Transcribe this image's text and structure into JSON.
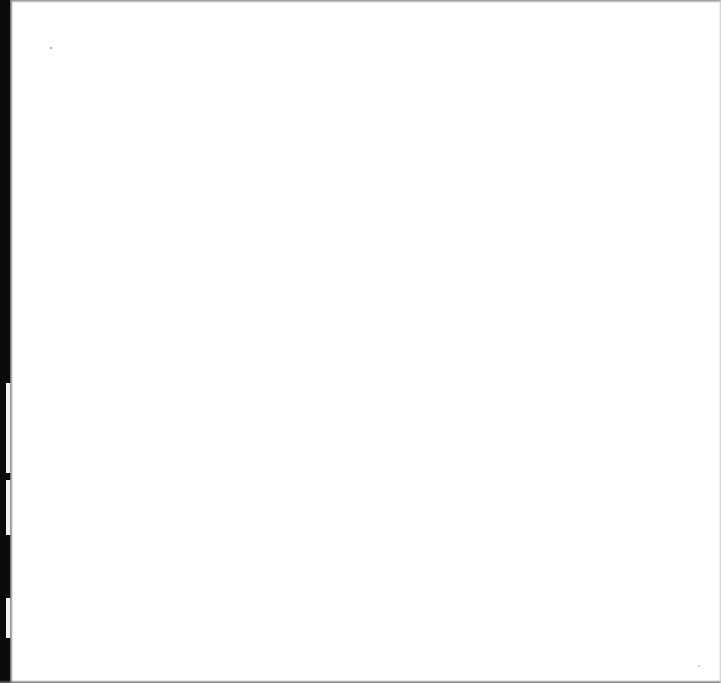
{
  "page": {
    "type": "blank-scanned-page",
    "text": "",
    "background_color": "#ffffff",
    "edge_color": "#0a0a0a"
  }
}
